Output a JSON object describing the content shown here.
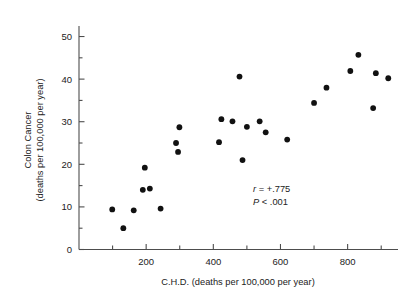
{
  "figure": {
    "background": "#ffffff",
    "point_color": "#111111",
    "axis_color": "#4d4d4d",
    "text_color": "#222222"
  },
  "annotations": {
    "r_symbol": "r",
    "r_text": " = +.775",
    "p_symbol": "P",
    "p_text": " < .001"
  },
  "chart_data": {
    "type": "scatter",
    "title": "",
    "xlabel": "C.H.D. (deaths per 100,000 per year)",
    "ylabel_line1": "Colon Cancer",
    "ylabel_line2": "(deaths per 100,000 per year)",
    "xlim": [
      0,
      950
    ],
    "ylim": [
      0,
      52
    ],
    "xticks": [
      200,
      400,
      600,
      800
    ],
    "xticklabels": [
      "200",
      "400",
      "600",
      "800"
    ],
    "xminorticks": [
      100,
      300,
      500,
      700,
      900
    ],
    "yticks": [
      0,
      10,
      20,
      30,
      40,
      50
    ],
    "yticklabels": [
      "0",
      "10",
      "20",
      "30",
      "40",
      "50"
    ],
    "yminorticks": [
      5,
      15,
      25,
      35,
      45
    ],
    "grid": false,
    "legend": false,
    "annotations": [
      "r = +.775",
      "P < .001"
    ],
    "points": [
      {
        "x": 99,
        "y": 9.4
      },
      {
        "x": 132,
        "y": 5.0
      },
      {
        "x": 163,
        "y": 9.2
      },
      {
        "x": 190,
        "y": 14.0
      },
      {
        "x": 196,
        "y": 19.2
      },
      {
        "x": 211,
        "y": 14.3
      },
      {
        "x": 243,
        "y": 9.6
      },
      {
        "x": 289,
        "y": 25.0
      },
      {
        "x": 295,
        "y": 22.9
      },
      {
        "x": 299,
        "y": 28.7
      },
      {
        "x": 417,
        "y": 25.2
      },
      {
        "x": 424,
        "y": 30.6
      },
      {
        "x": 457,
        "y": 30.1
      },
      {
        "x": 478,
        "y": 40.6
      },
      {
        "x": 487,
        "y": 21.0
      },
      {
        "x": 500,
        "y": 28.8
      },
      {
        "x": 538,
        "y": 30.1
      },
      {
        "x": 556,
        "y": 27.5
      },
      {
        "x": 620,
        "y": 25.8
      },
      {
        "x": 700,
        "y": 34.4
      },
      {
        "x": 737,
        "y": 38.0
      },
      {
        "x": 808,
        "y": 41.9
      },
      {
        "x": 832,
        "y": 45.7
      },
      {
        "x": 876,
        "y": 33.2
      },
      {
        "x": 884,
        "y": 41.4
      },
      {
        "x": 921,
        "y": 40.2
      }
    ]
  }
}
